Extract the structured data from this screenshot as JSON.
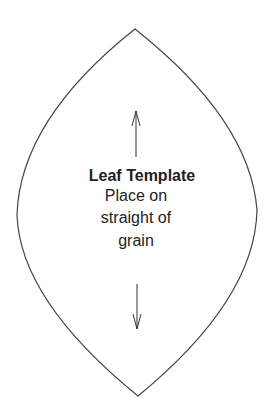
{
  "template": {
    "title": "Leaf Template",
    "instructions": [
      "Place on",
      "straight of",
      "grain"
    ]
  },
  "icons": {
    "top_arrow": "arrow-up-icon",
    "bottom_arrow": "arrow-down-icon"
  },
  "colors": {
    "outline": "#444444",
    "text": "#222222",
    "background": "#ffffff"
  }
}
